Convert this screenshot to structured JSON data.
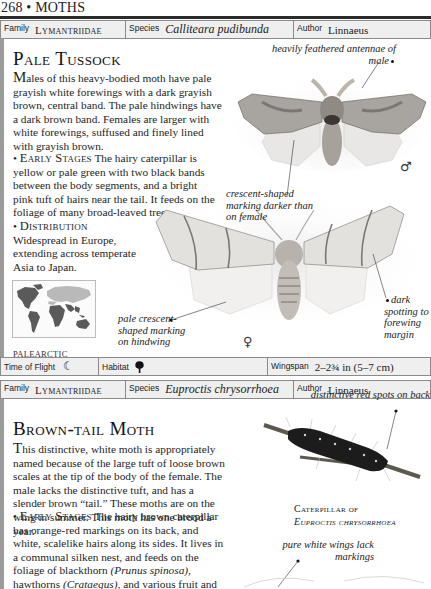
{
  "page": {
    "number": "268",
    "separator": "•",
    "section": "MOTHS"
  },
  "species1": {
    "info": {
      "family_label": "Family",
      "family": "Lymantriidae",
      "species_label": "Species",
      "species": "Calliteara pudibunda",
      "author_label": "Author",
      "author": "Linnaeus"
    },
    "title": "Pale Tussock",
    "description": {
      "dropcap": "M",
      "text": "ales of this heavy-bodied moth have pale grayish white forewings with a dark grayish brown, central band. The pale hindwings have a dark brown band. Females are larger with white forewings, suffused and finely lined with grayish brown."
    },
    "early_stages": {
      "bullet": "•",
      "heading": "Early Stages",
      "text": "The hairy caterpillar is yellow or pale green with two black bands between the body segments, and a bright pink tuft of hairs near the tail. It feeds on the foliage of many broad-leaved trees."
    },
    "distribution": {
      "bullet": "•",
      "heading": "Distribution",
      "text": "Widespread in Europe, extending across temperate Asia to Japan."
    },
    "map": {
      "icon": "world-map-icon",
      "region": "PALEARCTIC",
      "colors": {
        "highlight": "#5a5a5a",
        "other": "#b9b9b9"
      }
    },
    "annotations": [
      {
        "id": "antennae",
        "text": "heavily feathered antennae of male"
      },
      {
        "id": "crescent-male",
        "text": "crescent-shaped marking darker than on female"
      },
      {
        "id": "crescent-hindwing",
        "text": "pale crescent-shaped marking on hindwing"
      },
      {
        "id": "spotting",
        "text": "dark spotting to forewing margin"
      }
    ],
    "male_symbol": "♂",
    "female_symbol": "♀",
    "stats": {
      "flight_label": "Time of Flight",
      "flight_icon": "moon-icon",
      "flight_glyph": "☾",
      "habitat_label": "Habitat",
      "habitat_icon": "tree-icon",
      "wingspan_label": "Wingspan",
      "wingspan": "2–2¾ in (5–7 cm)"
    }
  },
  "species2": {
    "info": {
      "family_label": "Family",
      "family": "Lymantriidae",
      "species_label": "Species",
      "species": "Euproctis chrysorrhoea",
      "author_label": "Author",
      "author": "Linnaeus"
    },
    "title": "Brown-tail Moth",
    "description": {
      "dropcap": "T",
      "text": "his distinctive, white moth is appropriately named because of the large tuft of loose brown scales at the tip of the body of the female. The male lacks the distinctive tuft, and has a slender brown “tail.” These moths are on the wing in summer. This moth has one brood a year."
    },
    "early_stages": {
      "bullet": "•",
      "heading": "Early Stages",
      "text_1": "The hairy brown caterpillar has orange-red markings on its back, and white, scalelike hairs along its sides. It lives in a communal silken nest, and feeds on the foliage of blackthorn ",
      "latin_1": "(Prunus spinosa),",
      "text_2": " hawthorns ",
      "latin_2": "(Crataegus),",
      "text_3": " and various fruit and ornamental trees. The caterpillar has barbed"
    },
    "caption": {
      "line1": "Caterpillar of",
      "line2": "Euproctis chrysorrhoea"
    },
    "annotations": [
      {
        "id": "red-spots",
        "text": "distinctive red spots on back"
      },
      {
        "id": "white-wings",
        "text": "pure white wings lack markings"
      }
    ]
  }
}
